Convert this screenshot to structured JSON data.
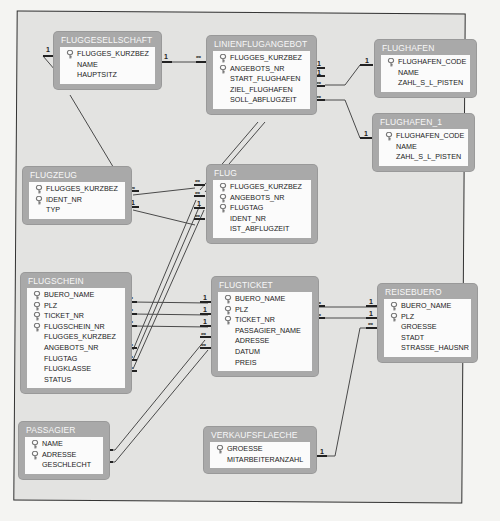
{
  "tables": {
    "fluggesellschaft": {
      "title": "FLUGGESELLSCHAFT",
      "fields": [
        {
          "name": "FLUGGES_KURZBEZ",
          "key": true
        },
        {
          "name": "NAME",
          "key": false
        },
        {
          "name": "HAUPTSITZ",
          "key": false
        }
      ]
    },
    "linienflugangebot": {
      "title": "LINIENFLUGANGEBOT",
      "fields": [
        {
          "name": "FLUGGES_KURZBEZ",
          "key": true
        },
        {
          "name": "ANGEBOTS_NR",
          "key": true
        },
        {
          "name": "START_FLUGHAFEN",
          "key": false
        },
        {
          "name": "ZIEL_FLUGHAFEN",
          "key": false
        },
        {
          "name": "SOLL_ABFLUGZEIT",
          "key": false
        }
      ]
    },
    "flughafen": {
      "title": "FLUGHAFEN",
      "fields": [
        {
          "name": "FLUGHAFEN_CODE",
          "key": true
        },
        {
          "name": "NAME",
          "key": false
        },
        {
          "name": "ZAHL_S_L_PISTEN",
          "key": false
        }
      ]
    },
    "flughafen_1": {
      "title": "FLUGHAFEN_1",
      "fields": [
        {
          "name": "FLUGHAFEN_CODE",
          "key": true
        },
        {
          "name": "NAME",
          "key": false
        },
        {
          "name": "ZAHL_S_L_PISTEN",
          "key": false
        }
      ]
    },
    "flugzeug": {
      "title": "FLUGZEUG",
      "fields": [
        {
          "name": "FLUGGES_KURZBEZ",
          "key": true
        },
        {
          "name": "IDENT_NR",
          "key": true
        },
        {
          "name": "TYP",
          "key": false
        }
      ]
    },
    "flug": {
      "title": "FLUG",
      "fields": [
        {
          "name": "FLUGGES_KURZBEZ",
          "key": true
        },
        {
          "name": "ANGEBOTS_NR",
          "key": true
        },
        {
          "name": "FLUGTAG",
          "key": true
        },
        {
          "name": "IDENT_NR",
          "key": false
        },
        {
          "name": "IST_ABFLUGZEIT",
          "key": false
        }
      ]
    },
    "flugschein": {
      "title": "FLUGSCHEIN",
      "fields": [
        {
          "name": "BUERO_NAME",
          "key": true
        },
        {
          "name": "PLZ",
          "key": true
        },
        {
          "name": "TICKET_NR",
          "key": true
        },
        {
          "name": "FLUGSCHEIN_NR",
          "key": true
        },
        {
          "name": "FLUGGES_KURZBEZ",
          "key": false
        },
        {
          "name": "ANGEBOTS_NR",
          "key": false
        },
        {
          "name": "FLUGTAG",
          "key": false
        },
        {
          "name": "FLUGKLASSE",
          "key": false
        },
        {
          "name": "STATUS",
          "key": false
        }
      ]
    },
    "flugticket": {
      "title": "FLUGTICKET",
      "fields": [
        {
          "name": "BUERO_NAME",
          "key": true
        },
        {
          "name": "PLZ",
          "key": true
        },
        {
          "name": "TICKET_NR",
          "key": true
        },
        {
          "name": "PASSAGIER_NAME",
          "key": false
        },
        {
          "name": "ADRESSE",
          "key": false
        },
        {
          "name": "DATUM",
          "key": false
        },
        {
          "name": "PREIS",
          "key": false
        }
      ]
    },
    "reisebuero": {
      "title": "REISEBUERO",
      "fields": [
        {
          "name": "BUERO_NAME",
          "key": true
        },
        {
          "name": "PLZ",
          "key": true
        },
        {
          "name": "GROESSE",
          "key": false
        },
        {
          "name": "STADT",
          "key": false
        },
        {
          "name": "STRASSE_HAUSNR",
          "key": false
        }
      ]
    },
    "passagier": {
      "title": "PASSAGIER",
      "fields": [
        {
          "name": "NAME",
          "key": true
        },
        {
          "name": "ADRESSE",
          "key": true
        },
        {
          "name": "GESCHLECHT",
          "key": false
        }
      ]
    },
    "verkaufsflaeche": {
      "title": "VERKAUFSFLAECHE",
      "fields": [
        {
          "name": "GROESSE",
          "key": true
        },
        {
          "name": "MITARBEITERANZAHL",
          "key": false
        }
      ]
    }
  },
  "cardinality": {
    "one": "1",
    "many": "∞"
  },
  "icons": {
    "primary_key": "key-icon"
  },
  "colors": {
    "table_header": "#a9a9a9",
    "canvas": "#e3e3e1",
    "line": "#444444"
  }
}
